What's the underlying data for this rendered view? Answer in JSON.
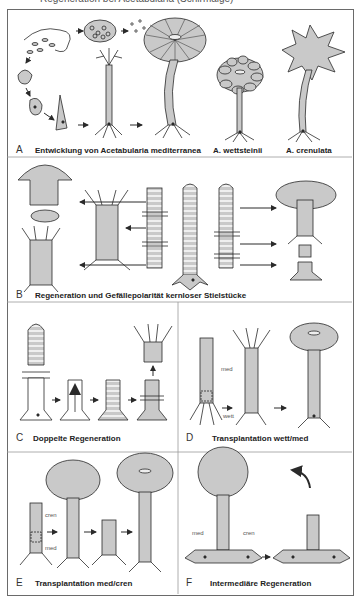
{
  "figure": {
    "top_cut_text": "Regeneration bei Acetabularia (Schirmalge)",
    "panels": [
      {
        "letter": "A",
        "caption": "Entwicklung von Acetabularia mediterranea",
        "extra_captions": [
          "A. wettsteinii",
          "A. crenulata"
        ]
      },
      {
        "letter": "B",
        "caption": "Regeneration und Gefällepolarität kernloser Stielstücke"
      },
      {
        "letter": "C",
        "caption": "Doppelte Regeneration"
      },
      {
        "letter": "D",
        "caption": "Transplantation wett/med",
        "labels": [
          "med",
          "wett"
        ]
      },
      {
        "letter": "E",
        "caption": "Transplantation med/cren",
        "labels": [
          "cren",
          "med"
        ]
      },
      {
        "letter": "F",
        "caption": "Intermediäre Regeneration",
        "labels": [
          "med",
          "cren"
        ]
      }
    ]
  },
  "colors": {
    "fill": "#c9c9c9",
    "stroke": "#2a2a2a",
    "stripe": "#ececec",
    "frame": "#6a6a6a"
  }
}
